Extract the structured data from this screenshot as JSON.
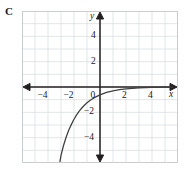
{
  "panel": {
    "label": "C"
  },
  "colors": {
    "grid": "#d5d8dc",
    "grid_major": "#c4c8cc",
    "axis": "#231f20",
    "curve": "#3a3a3a",
    "frame": "#c9cdd2",
    "text": "#1a1a1a",
    "background": "#ffffff"
  },
  "chart_data": {
    "type": "line",
    "title": "",
    "xlabel": "x",
    "ylabel": "y",
    "xlim": [
      -6,
      6
    ],
    "ylim": [
      -6,
      6
    ],
    "grid": true,
    "grid_step": 1,
    "legend": "none",
    "x_ticks": [
      -4,
      -2,
      0,
      2,
      4
    ],
    "x_tick_labels": [
      "-4",
      "-2",
      "0",
      "2",
      "4"
    ],
    "y_ticks": [
      4,
      2,
      -2,
      -4
    ],
    "y_tick_labels": [
      "4",
      "2",
      "-2",
      "-4"
    ],
    "asymptote": 0,
    "series": [
      {
        "name": "curve",
        "description": "decreasing exponential approaching y = 0 from below",
        "x": [
          -3.1,
          -3.0,
          -2.8,
          -2.6,
          -2.4,
          -2.2,
          -2.0,
          -1.8,
          -1.6,
          -1.4,
          -1.2,
          -1.0,
          -0.8,
          -0.6,
          -0.4,
          -0.2,
          0.0,
          0.25,
          0.5,
          0.75,
          1.0,
          1.5,
          2.0,
          2.5,
          3.0,
          3.5,
          4.0,
          4.5,
          5.0,
          5.6
        ],
        "y": [
          -6.0,
          -5.4,
          -4.6,
          -3.95,
          -3.4,
          -2.95,
          -2.55,
          -2.2,
          -1.9,
          -1.66,
          -1.44,
          -1.25,
          -1.09,
          -0.95,
          -0.82,
          -0.72,
          -0.62,
          -0.52,
          -0.43,
          -0.36,
          -0.3,
          -0.21,
          -0.15,
          -0.1,
          -0.07,
          -0.05,
          -0.035,
          -0.025,
          -0.018,
          -0.012
        ]
      }
    ]
  },
  "axes": {
    "x_axis_arrow_left": "arrow-left",
    "x_axis_arrow_right": "arrow-right",
    "y_axis_arrow_up": "arrow-up",
    "y_axis_arrow_down": "arrow-down"
  }
}
